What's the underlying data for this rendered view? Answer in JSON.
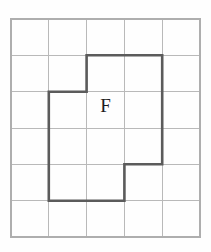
{
  "figure": {
    "label": "F",
    "label_position": {
      "col": 2.5,
      "row": 2.45
    },
    "colors": {
      "background": "#fefefe",
      "grid_line": "#b9b9b9",
      "grid_border": "#aeaeae",
      "shape_outline": "#5b5b5b",
      "label_text": "#1c1c1c"
    },
    "grid": {
      "columns": 5,
      "rows": 6,
      "origin_x": 11,
      "origin_y": 19,
      "cell_width": 37.8,
      "cell_height": 36.33,
      "x_lines": [
        11,
        48.8,
        86.6,
        124.4,
        162.2,
        200
      ],
      "y_lines": [
        19,
        55.3,
        91.7,
        128,
        164.3,
        200.7,
        237
      ]
    },
    "shape": {
      "name": "F",
      "area_cells": 11,
      "vertices_grid": [
        {
          "col": 2,
          "row": 1
        },
        {
          "col": 4,
          "row": 1
        },
        {
          "col": 4,
          "row": 4
        },
        {
          "col": 3,
          "row": 4
        },
        {
          "col": 3,
          "row": 5
        },
        {
          "col": 1,
          "row": 5
        },
        {
          "col": 1,
          "row": 2
        },
        {
          "col": 2,
          "row": 2
        }
      ],
      "vertices_px": [
        {
          "x": 86.6,
          "y": 55.3
        },
        {
          "x": 162.2,
          "y": 55.3
        },
        {
          "x": 162.2,
          "y": 164.3
        },
        {
          "x": 124.4,
          "y": 164.3
        },
        {
          "x": 124.4,
          "y": 200.7
        },
        {
          "x": 48.8,
          "y": 200.7
        },
        {
          "x": 48.8,
          "y": 91.7
        },
        {
          "x": 86.6,
          "y": 91.7
        }
      ],
      "path_d": "M 86.6 55.3 L 162.2 55.3 L 162.2 164.3 L 124.4 164.3 L 124.4 200.7 L 48.8 200.7 L 48.8 91.7 L 86.6 91.7 Z"
    }
  }
}
